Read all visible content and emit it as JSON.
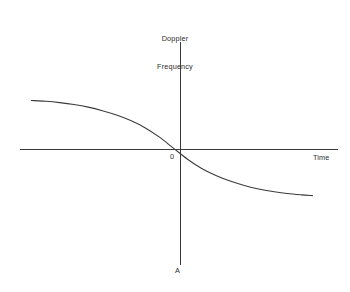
{
  "figure": {
    "background_color": "#ffffff",
    "line_color": "#3b3b3b",
    "width": 350,
    "height": 292
  },
  "labels": {
    "y_axis_line1": "Doppler",
    "y_axis_line2": "Frequency",
    "x_axis": "Time",
    "origin": "0",
    "bottom_marker": "A"
  },
  "chart_data": {
    "type": "line",
    "title": "",
    "subtitle": "",
    "xlabel": "Time",
    "ylabel": "Doppler Frequency",
    "grid": false,
    "legend": false,
    "legend_position": "none",
    "annotations": [
      {
        "text": "0",
        "x": 0,
        "y": 0,
        "note": "origin marker"
      },
      {
        "text": "A",
        "x": 0,
        "y": -1.0,
        "note": "label at bottom end of vertical axis"
      }
    ],
    "axes": {
      "x_axis_y_value": 0,
      "y_axis_x_value": 0,
      "xlim": [
        -1.08,
        1.16
      ],
      "ylim": [
        -0.86,
        0.78
      ],
      "x_ticks": [],
      "y_ticks": [],
      "x_tick_labels": [],
      "y_tick_labels": [],
      "arrowheads": false
    },
    "series": [
      {
        "name": "Doppler frequency shift",
        "shape": "sigmoid-decreasing",
        "description": "Monotonically decreasing S-shaped curve crossing zero at the origin",
        "x": [
          -1.0,
          -0.9,
          -0.8,
          -0.7,
          -0.6,
          -0.5,
          -0.4,
          -0.3,
          -0.2,
          -0.1,
          0.0,
          0.1,
          0.2,
          0.3,
          0.4,
          0.5,
          0.6,
          0.7,
          0.8,
          0.9,
          0.98
        ],
        "values": [
          0.35,
          0.344,
          0.334,
          0.32,
          0.301,
          0.275,
          0.243,
          0.202,
          0.15,
          0.082,
          0.0,
          -0.082,
          -0.15,
          -0.202,
          -0.243,
          -0.275,
          -0.301,
          -0.32,
          -0.334,
          -0.344,
          -0.35
        ]
      }
    ]
  }
}
